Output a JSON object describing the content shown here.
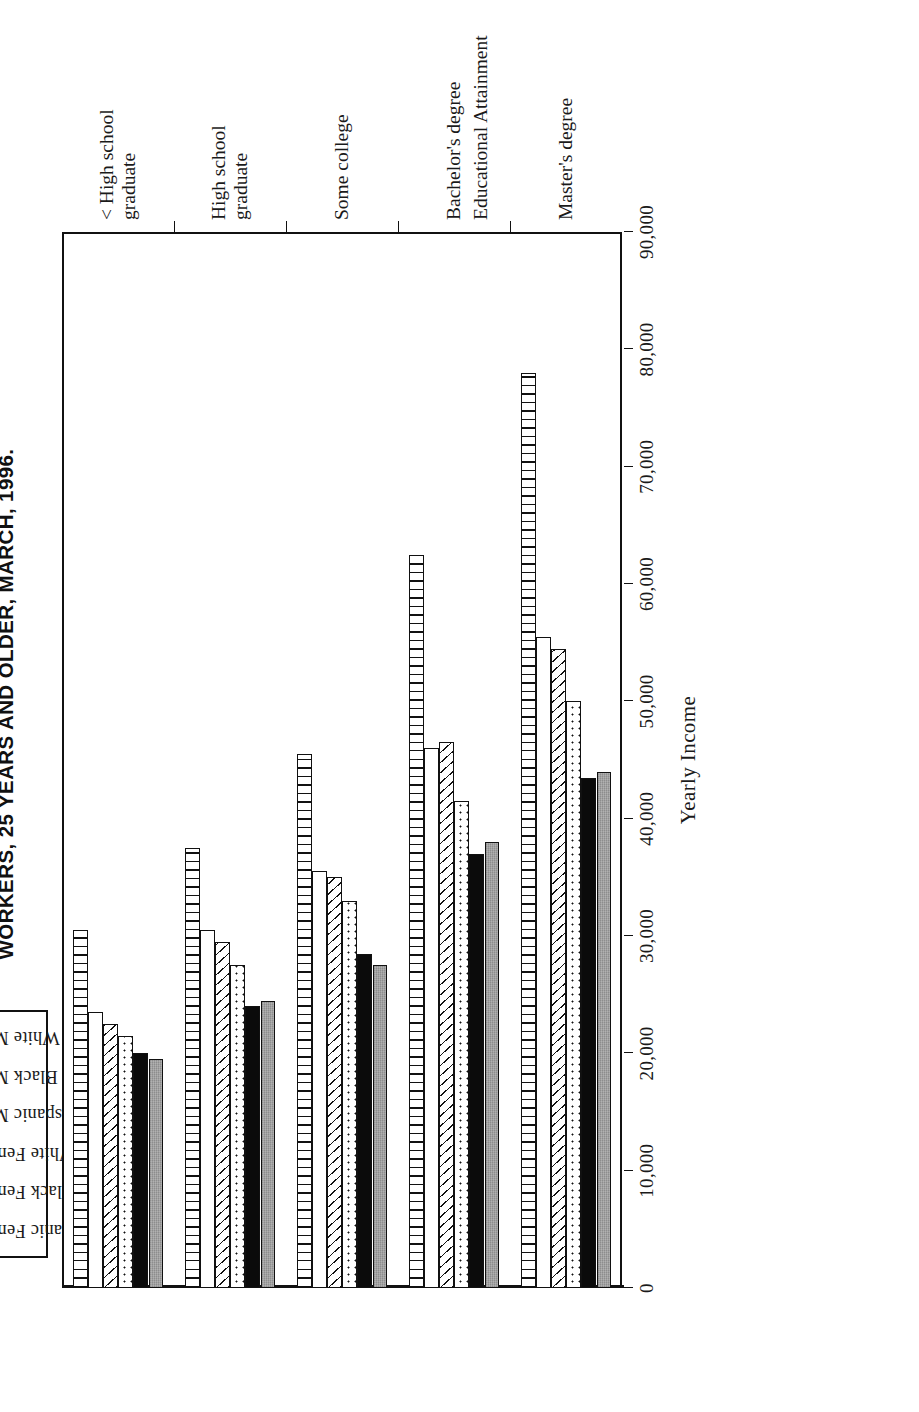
{
  "chart_data": {
    "type": "bar",
    "orientation": "horizontal-grouped",
    "title": "WORKERS, 25 YEARS AND OLDER, MARCH, 1996.",
    "xlabel": "Educational Attainment",
    "ylabel": "Yearly Income",
    "ylim": [
      0,
      90000
    ],
    "ytick_labels": [
      "0",
      "10,000",
      "20,000",
      "30,000",
      "40,000",
      "50,000",
      "60,000",
      "70,000",
      "80,000",
      "90,000"
    ],
    "ytick_values": [
      0,
      10000,
      20000,
      30000,
      40000,
      50000,
      60000,
      70000,
      80000,
      90000
    ],
    "grid": false,
    "legend_position": "top",
    "categories": [
      "< High school graduate",
      "High school graduate",
      "Some college",
      "Bachelor's degree",
      "Master's degree"
    ],
    "series": [
      {
        "name": "White Male",
        "pattern": "vertical-lines",
        "values": [
          30500,
          37500,
          45500,
          62500,
          78000
        ]
      },
      {
        "name": "Black Male",
        "pattern": "white",
        "values": [
          23500,
          30500,
          35500,
          46000,
          55500
        ]
      },
      {
        "name": "Hispanic Male",
        "pattern": "diagonal-lines",
        "values": [
          22500,
          29500,
          35000,
          46500,
          54500
        ]
      },
      {
        "name": "White Female",
        "pattern": "dots",
        "values": [
          21500,
          27500,
          33000,
          41500,
          50000
        ]
      },
      {
        "name": "Black Female",
        "pattern": "solid-black",
        "values": [
          20000,
          24000,
          28500,
          37000,
          43500
        ]
      },
      {
        "name": "Hispanic Female",
        "pattern": "gray",
        "values": [
          19500,
          24500,
          27500,
          38000,
          44000
        ]
      }
    ]
  },
  "legend": {
    "items": [
      {
        "label": "Hispanic Female",
        "pattern": "gray"
      },
      {
        "label": "Black Female",
        "pattern": "solid-black"
      },
      {
        "label": "White Female",
        "pattern": "dots"
      },
      {
        "label": "Hispanic Male",
        "pattern": "diagonal-lines"
      },
      {
        "label": "Black Male",
        "pattern": "white"
      },
      {
        "label": "White Male",
        "pattern": "vertical-lines"
      }
    ]
  }
}
